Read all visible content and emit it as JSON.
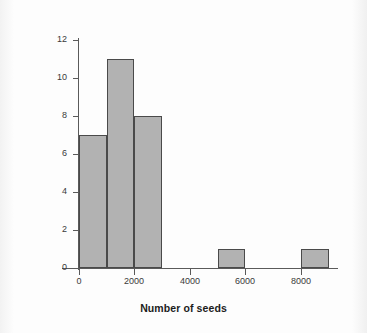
{
  "chart_data": {
    "type": "bar",
    "subtype": "histogram",
    "title": "",
    "subtitle": "",
    "xlabel": "Number of seeds",
    "ylabel": "Frequency",
    "xlim": [
      0,
      9300
    ],
    "ylim": [
      0,
      12
    ],
    "bin_width": 1000,
    "grid": false,
    "legend": null,
    "categories": [
      "0-1000",
      "1000-2000",
      "2000-3000",
      "3000-4000",
      "4000-5000",
      "5000-6000",
      "6000-7000",
      "7000-8000",
      "8000-9000"
    ],
    "bins": [
      {
        "start": 0,
        "end": 1000,
        "value": 7
      },
      {
        "start": 1000,
        "end": 2000,
        "value": 11
      },
      {
        "start": 2000,
        "end": 3000,
        "value": 8
      },
      {
        "start": 3000,
        "end": 4000,
        "value": 0
      },
      {
        "start": 4000,
        "end": 5000,
        "value": 0
      },
      {
        "start": 5000,
        "end": 6000,
        "value": 1
      },
      {
        "start": 6000,
        "end": 7000,
        "value": 0
      },
      {
        "start": 7000,
        "end": 8000,
        "value": 0
      },
      {
        "start": 8000,
        "end": 9000,
        "value": 1
      }
    ],
    "values": [
      7,
      11,
      8,
      0,
      0,
      1,
      0,
      0,
      1
    ],
    "xticks": [
      0,
      2000,
      4000,
      6000,
      8000
    ],
    "xtick_labels": [
      "0",
      "2000",
      "4000",
      "6000",
      "8000"
    ],
    "yticks": [
      0,
      2,
      4,
      6,
      8,
      10,
      12
    ],
    "ytick_labels": [
      "0",
      "2",
      "4",
      "6",
      "8",
      "10",
      "12"
    ],
    "colors": {
      "bar_fill": "#b2b2b2",
      "bar_edge": "#4a4a4a",
      "axis": "#5a5a5a",
      "text": "#1c1c1c",
      "background": "#fbfbfb"
    }
  }
}
